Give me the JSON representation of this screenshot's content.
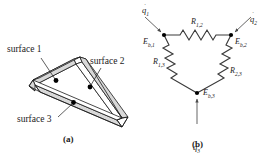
{
  "figure": {
    "panel_a": {
      "caption": "(a)",
      "description": "triangular enclosure with three surfaces",
      "labels": [
        {
          "id": "surface-1",
          "text": "surface 1"
        },
        {
          "id": "surface-2",
          "text": "surface 2"
        },
        {
          "id": "surface-3",
          "text": "surface 3"
        }
      ],
      "colors": {
        "outline": "#1a1a1a",
        "face_fill": "#ffffff",
        "edge_fill": "#d9d9d9",
        "marker": "#000000"
      }
    },
    "panel_b": {
      "caption": "(b)",
      "description": "radiation network: delta of surface resistances",
      "nodes": [
        {
          "id": "node-1",
          "label": "E",
          "sub": "b,1"
        },
        {
          "id": "node-2",
          "label": "E",
          "sub": "b,2"
        },
        {
          "id": "node-3",
          "label": "E",
          "sub": "b,3"
        }
      ],
      "resistors": [
        {
          "id": "resistor-12",
          "label": "R",
          "sub": "1,2"
        },
        {
          "id": "resistor-13",
          "label": "R",
          "sub": "1,3"
        },
        {
          "id": "resistor-23",
          "label": "R",
          "sub": "2,3"
        }
      ],
      "sources": [
        {
          "id": "source-q1",
          "label": "q",
          "sub": "1",
          "dot": "˙"
        },
        {
          "id": "source-q2",
          "label": "q",
          "sub": "2",
          "dot": "˙"
        },
        {
          "id": "source-q3",
          "label": "q",
          "sub": "3",
          "dot": "˙"
        }
      ],
      "colors": {
        "wire": "#3a3a3a",
        "arrow": "#4a4a4a",
        "node_dot": "#000000",
        "text": "#1a1a1a"
      }
    }
  }
}
